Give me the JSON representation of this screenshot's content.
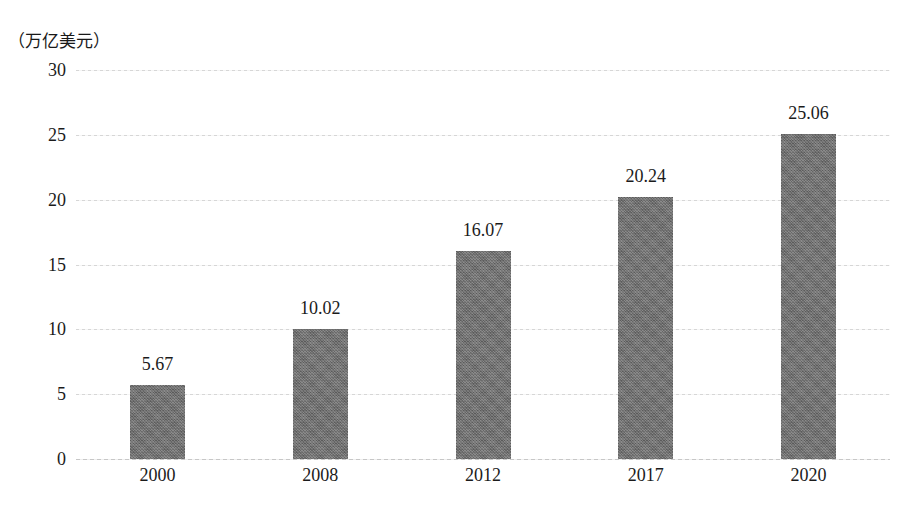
{
  "chart_data": {
    "type": "bar",
    "title": "",
    "subtitle": "",
    "unit_caption": "（万亿美元）",
    "xlabel": "",
    "ylabel": "",
    "categories": [
      "2000",
      "2008",
      "2012",
      "2017",
      "2020"
    ],
    "values": [
      5.67,
      10.02,
      16.07,
      20.24,
      25.06
    ],
    "value_labels": [
      "5.67",
      "10.02",
      "16.07",
      "20.24",
      "25.06"
    ],
    "series": [
      {
        "name": "",
        "values": [
          5.67,
          10.02,
          16.07,
          20.24,
          25.06
        ]
      }
    ],
    "ylim": [
      0,
      30
    ],
    "y_ticks": [
      0,
      5,
      10,
      15,
      20,
      25,
      30
    ],
    "y_tick_labels": [
      "0",
      "5",
      "10",
      "15",
      "20",
      "25",
      "30"
    ],
    "grid": true,
    "grid_axis": "y",
    "grid_style": "dotted",
    "legend": false,
    "legend_position": "none",
    "bar_color": "#6e6e6e",
    "grid_color": "#cfcfcf",
    "text_color": "#1b1b1b",
    "background_color": "#ffffff"
  }
}
